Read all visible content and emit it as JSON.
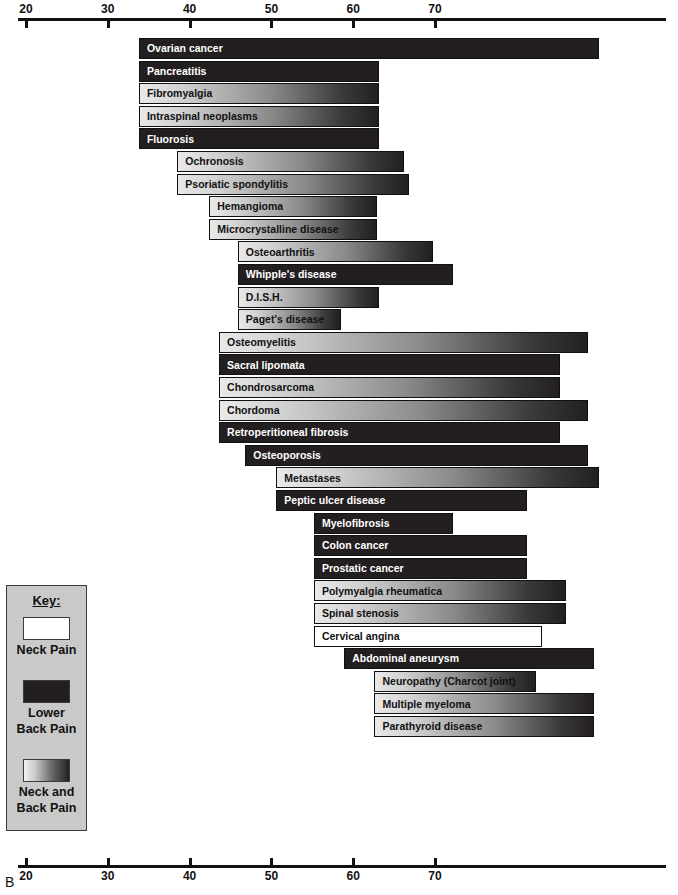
{
  "panel_letter": "B",
  "key": {
    "title": "Key:",
    "entries": [
      {
        "id": "neck",
        "label": "Neck Pain",
        "swatch": "white"
      },
      {
        "id": "lower",
        "label": "Lower\nBack Pain",
        "swatch": "dark"
      },
      {
        "id": "both",
        "label": "Neck and\nBack Pain",
        "swatch": "gradient"
      }
    ],
    "entry_labels": {
      "neck": "Neck Pain",
      "lower_line1": "Lower",
      "lower_line2": "Back Pain",
      "both_line1": "Neck and",
      "both_line2": "Back Pain"
    }
  },
  "axis": {
    "ticks": [
      20,
      30,
      40,
      50,
      60,
      70
    ],
    "tick_labels": [
      "20",
      "30",
      "40",
      "50",
      "60",
      "70"
    ],
    "min": 20,
    "max": 76,
    "top_axis_label": "",
    "bottom_axis_label": ""
  },
  "colors": {
    "neck_pain": "#ffffff",
    "lower_back_pain": "#231f20",
    "neck_and_back_pain_light": "#e9e9e9",
    "neck_and_back_pain_dark": "#231f20",
    "key_background": "#c9c9c9",
    "ink": "#111111"
  },
  "chart_data": {
    "type": "bar",
    "orientation": "horizontal",
    "title": "",
    "xlabel": "",
    "ylabel": "",
    "xlim": [
      20,
      76
    ],
    "grid": false,
    "legend_position": "bottom-left",
    "value_unit": "age (years)",
    "note": "Each horizontal bar spans the typical age range for the condition; fill encodes pain location category.",
    "legend": [
      {
        "name": "Neck Pain",
        "fill": "white"
      },
      {
        "name": "Lower Back Pain",
        "fill": "dark"
      },
      {
        "name": "Neck and Back Pain",
        "fill": "gradient"
      }
    ],
    "categories": [
      "Ovarian cancer",
      "Pancreatitis",
      "Fibromyalgia",
      "Intraspinal neoplasms",
      "Fluorosis",
      "Ochronosis",
      "Psoriatic spondylitis",
      "Hemangioma",
      "Microcrystalline disease",
      "Osteoarthritis",
      "Whipple's disease",
      "D.I.S.H.",
      "Paget's disease",
      "Osteomyelitis",
      "Sacral lipomata",
      "Chondrosarcoma",
      "Chordoma",
      "Retroperitioneal fibrosis",
      "Osteoporosis",
      "Metastases",
      "Peptic ulcer disease",
      "Myelofibrosis",
      "Colon cancer",
      "Prostatic cancer",
      "Polymyalgia rheumatica",
      "Spinal stenosis",
      "Cervical angina",
      "Abdominal aneurysm",
      "Neuropathy (Charcot joint)",
      "Multiple myeloma",
      "Parathyroid disease"
    ],
    "bars": [
      {
        "label": "Ovarian cancer",
        "start": 33.8,
        "end": 90.1,
        "category": "Lower Back Pain"
      },
      {
        "label": "Pancreatitis",
        "start": 33.8,
        "end": 63.2,
        "category": "Lower Back Pain"
      },
      {
        "label": "Fibromyalgia",
        "start": 33.8,
        "end": 63.2,
        "category": "Neck and Back Pain"
      },
      {
        "label": "Intraspinal neoplasms",
        "start": 33.8,
        "end": 63.2,
        "category": "Neck and Back Pain"
      },
      {
        "label": "Fluorosis",
        "start": 33.8,
        "end": 63.2,
        "category": "Lower Back Pain"
      },
      {
        "label": "Ochronosis",
        "start": 38.5,
        "end": 66.2,
        "category": "Neck and Back Pain"
      },
      {
        "label": "Psoriatic spondylitis",
        "start": 38.5,
        "end": 66.8,
        "category": "Neck and Back Pain"
      },
      {
        "label": "Hemangioma",
        "start": 42.4,
        "end": 62.9,
        "category": "Neck and Back Pain"
      },
      {
        "label": "Microcrystalline disease",
        "start": 42.4,
        "end": 62.9,
        "category": "Neck and Back Pain"
      },
      {
        "label": "Osteoarthritis",
        "start": 45.9,
        "end": 69.7,
        "category": "Neck and Back Pain"
      },
      {
        "label": "Whipple's disease",
        "start": 45.9,
        "end": 72.2,
        "category": "Lower Back Pain"
      },
      {
        "label": "D.I.S.H.",
        "start": 45.9,
        "end": 63.2,
        "category": "Neck and Back Pain"
      },
      {
        "label": "Paget's disease",
        "start": 45.9,
        "end": 58.5,
        "category": "Neck and Back Pain"
      },
      {
        "label": "Osteomyelitis",
        "start": 43.6,
        "end": 88.7,
        "category": "Neck and Back Pain"
      },
      {
        "label": "Sacral lipomata",
        "start": 43.6,
        "end": 85.3,
        "category": "Lower Back Pain"
      },
      {
        "label": "Chondrosarcoma",
        "start": 43.6,
        "end": 85.3,
        "category": "Neck and Back Pain"
      },
      {
        "label": "Chordoma",
        "start": 43.6,
        "end": 88.7,
        "category": "Neck and Back Pain"
      },
      {
        "label": "Retroperitioneal fibrosis",
        "start": 43.6,
        "end": 85.3,
        "category": "Lower Back Pain"
      },
      {
        "label": "Osteoporosis",
        "start": 46.8,
        "end": 88.7,
        "category": "Lower Back Pain"
      },
      {
        "label": "Metastases",
        "start": 50.6,
        "end": 90.1,
        "category": "Neck and Back Pain"
      },
      {
        "label": "Peptic ulcer disease",
        "start": 50.6,
        "end": 81.2,
        "category": "Lower Back Pain"
      },
      {
        "label": "Myelofibrosis",
        "start": 55.2,
        "end": 72.2,
        "category": "Lower Back Pain"
      },
      {
        "label": "Colon cancer",
        "start": 55.2,
        "end": 81.2,
        "category": "Lower Back Pain"
      },
      {
        "label": "Prostatic cancer",
        "start": 55.2,
        "end": 81.2,
        "category": "Lower Back Pain"
      },
      {
        "label": "Polymyalgia rheumatica",
        "start": 55.2,
        "end": 86.0,
        "category": "Neck and Back Pain"
      },
      {
        "label": "Spinal stenosis",
        "start": 55.2,
        "end": 86.0,
        "category": "Neck and Back Pain"
      },
      {
        "label": "Cervical angina",
        "start": 55.2,
        "end": 83.1,
        "category": "Neck Pain"
      },
      {
        "label": "Abdominal aneurysm",
        "start": 58.9,
        "end": 89.4,
        "category": "Lower Back Pain"
      },
      {
        "label": "Neuropathy (Charcot joint)",
        "start": 62.6,
        "end": 82.4,
        "category": "Neck and Back Pain"
      },
      {
        "label": "Multiple myeloma",
        "start": 62.6,
        "end": 89.4,
        "category": "Neck and Back Pain"
      },
      {
        "label": "Parathyroid disease",
        "start": 62.6,
        "end": 89.4,
        "category": "Neck and Back Pain"
      }
    ]
  }
}
